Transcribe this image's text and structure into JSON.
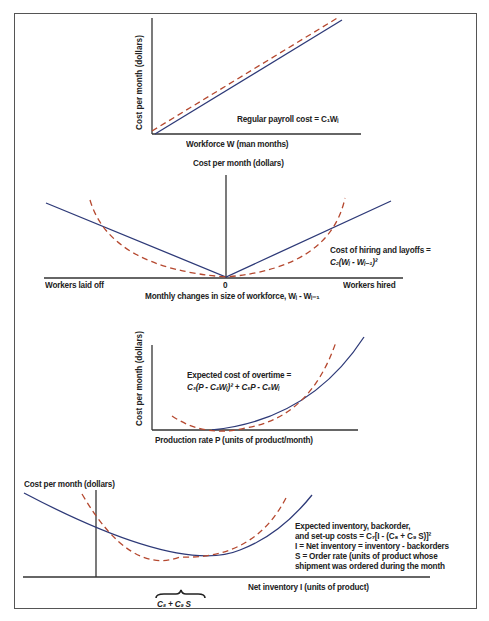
{
  "colors": {
    "solid_line": "#2e3a78",
    "dashed_line": "#b5482f",
    "axis": "#333333",
    "frame": "#555555",
    "text": "#222222"
  },
  "panels": [
    {
      "id": "regular-payroll",
      "ylabel": "Cost per month (dollars)",
      "xlabel": "Workforce W (man months)",
      "annotation": "Regular payroll cost = C₁Wᵢ",
      "curve_shape": "linear increasing"
    },
    {
      "id": "hiring-layoffs",
      "ylabel": "Cost per month (dollars)",
      "xlabel": "Monthly changes in size of workforce, Wᵢ - Wᵢ₋₁",
      "left_label": "Workers laid off",
      "center_tick": "0",
      "right_label": "Workers hired",
      "annotation_line1": "Cost of hiring and layoffs =",
      "annotation_line2": "C₂(Wᵢ - Wᵢ₋₁)²",
      "curve_shape": "V-shape (solid) vs parabola (dashed)"
    },
    {
      "id": "overtime",
      "ylabel": "Cost per month (dollars)",
      "xlabel": "Production rate P (units of product/month)",
      "annotation_line1": "Expected cost of overtime =",
      "annotation_line2": "C₃(P - C₄Wᵢ)² + C₅P - C₆Wᵢ",
      "curve_shape": "convex increasing"
    },
    {
      "id": "inventory",
      "ylabel": "Cost per month (dollars)",
      "xlabel": "Net inventory I (units of product)",
      "annotation_line1": "Expected inventory, backorder,",
      "annotation_line2": "and set-up costs = C₇[I - (C₈ + C₉ S)]²",
      "annotation_line3": "I = Net inventory = inventory - backorders",
      "annotation_line4": "S = Order rate (units of product whose",
      "annotation_line5": "shipment was ordered during the month",
      "brace_label": "C₈ + C₉ S",
      "curve_shape": "U-shape (solid) vs parabola (dashed)"
    }
  ]
}
